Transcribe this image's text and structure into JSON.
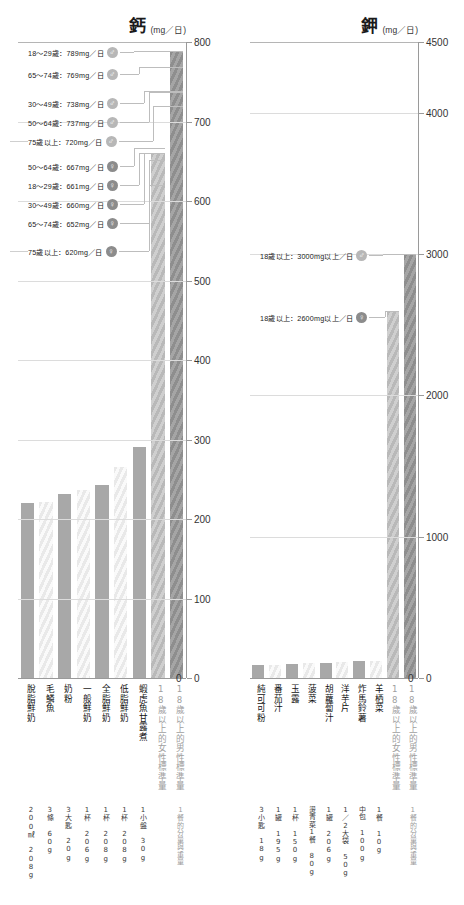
{
  "chart_data": [
    {
      "type": "bar",
      "id": "calcium",
      "title": "鈣",
      "unit_label": "(mg／日)",
      "ylabel": "mg／日",
      "ylim": [
        0,
        800
      ],
      "yticks": [
        0,
        100,
        200,
        300,
        400,
        500,
        600,
        700,
        800
      ],
      "grid": true,
      "categories": [
        "脫脂鮮奶",
        "毛鱗魚",
        "奶粉",
        "一般鮮奶",
        "全脂鮮奶",
        "低脂鮮奶",
        "蝦虎魚甘露煮"
      ],
      "values": [
        220,
        222,
        232,
        236,
        243,
        265,
        290
      ],
      "servings": [
        {
          "amount": "200㎖",
          "weight": "208g"
        },
        {
          "amount": "3條",
          "weight": "60g"
        },
        {
          "amount": "3大匙",
          "weight": "20g"
        },
        {
          "amount": "1杯",
          "weight": "206g"
        },
        {
          "amount": "1杯",
          "weight": "208g"
        },
        {
          "amount": "1杯",
          "weight": "208g"
        },
        {
          "amount": "1小盤",
          "weight": "30g"
        }
      ],
      "reference_bars": [
        {
          "label": "18歲以上的女性標準量",
          "value": 661,
          "sex": "female",
          "note": "1餐的分量與重量"
        },
        {
          "label": "18歲以上的男性標準量",
          "value": 789,
          "sex": "male",
          "note": "1餐的分量與重量"
        }
      ],
      "annotations": [
        {
          "text": "18〜29歲：789mg／日",
          "value": 789,
          "sex": "male"
        },
        {
          "text": "65〜74歲：769mg／日",
          "value": 769,
          "sex": "male"
        },
        {
          "text": "30〜49歲：738mg／日",
          "value": 738,
          "sex": "male"
        },
        {
          "text": "50〜64歲：737mg／日",
          "value": 737,
          "sex": "male"
        },
        {
          "text": "75歲以上：720mg／日",
          "value": 720,
          "sex": "male"
        },
        {
          "text": "50〜64歲：667mg／日",
          "value": 667,
          "sex": "female"
        },
        {
          "text": "18〜29歲：661mg／日",
          "value": 661,
          "sex": "female"
        },
        {
          "text": "30〜49歲：660mg／日",
          "value": 660,
          "sex": "female"
        },
        {
          "text": "65〜74歲：652mg／日",
          "value": 652,
          "sex": "female"
        },
        {
          "text": "75歲以上：620mg／日",
          "value": 620,
          "sex": "female"
        }
      ]
    },
    {
      "type": "bar",
      "id": "potassium",
      "title": "鉀",
      "unit_label": "(mg／日)",
      "ylabel": "mg／日",
      "ylim": [
        0,
        4500
      ],
      "yticks": [
        0,
        1000,
        2000,
        3000,
        4000,
        4500
      ],
      "grid": true,
      "categories": [
        "純可可粉",
        "番茄汁",
        "玉露",
        "菠菜",
        "胡蘿蔔汁",
        "洋芋片",
        "炸馬鈴薯",
        "羊栖菜"
      ],
      "values": [
        90,
        92,
        98,
        103,
        108,
        112,
        118,
        120
      ],
      "servings": [
        {
          "amount": "3小匙",
          "weight": "18g"
        },
        {
          "amount": "1罐",
          "weight": "195g"
        },
        {
          "amount": "1杯",
          "weight": "150g"
        },
        {
          "amount": "燙青菜1餐",
          "weight": "80g"
        },
        {
          "amount": "1罐",
          "weight": "206g"
        },
        {
          "amount": "1／2大袋",
          "weight": "50g"
        },
        {
          "amount": "中包",
          "weight": "100g"
        },
        {
          "amount": "1餐",
          "weight": "10g"
        }
      ],
      "reference_bars": [
        {
          "label": "18歲以上的女性標準量",
          "value": 2600,
          "sex": "female",
          "note": "1餐的分量與重量"
        },
        {
          "label": "18歲以上的男性標準量",
          "value": 3000,
          "sex": "male",
          "note": "1餐的分量與重量"
        }
      ],
      "annotations": [
        {
          "text": "18歲以上：3000mg以上／日",
          "value": 3000,
          "sex": "male"
        },
        {
          "text": "18歲以上：2600mg以上／日",
          "value": 2600,
          "sex": "female"
        }
      ]
    }
  ],
  "icons": {
    "male": "♂",
    "female": "♀"
  },
  "colors": {
    "bar_solid": "#a8a8a8",
    "bar_stripe": "#e9e9e9",
    "ref_female": "#b9b9b9",
    "ref_male": "#8e8e8e",
    "grid": "#dcdcdc",
    "axis": "#9a9a9a",
    "text": "#1a1a1a",
    "ref_label": "#a0a0a0"
  }
}
